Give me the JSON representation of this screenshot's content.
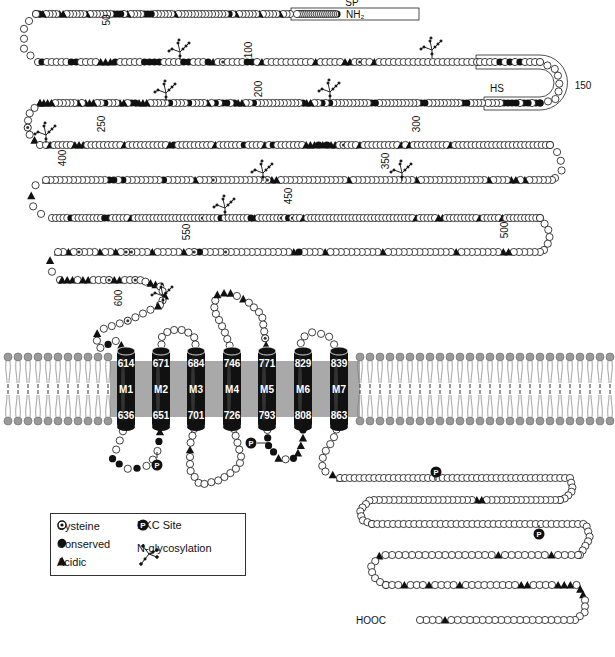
{
  "labels": {
    "n_terminus": "NH₂",
    "c_terminus": "HOOC",
    "signal_peptide": "SP",
    "hs_region": "HS",
    "residue_numbers": [
      {
        "text": "50",
        "x": 110,
        "y": 20,
        "rot": -90
      },
      {
        "text": "100",
        "x": 252,
        "y": 50,
        "rot": -90
      },
      {
        "text": "150",
        "x": 583,
        "y": 89,
        "rot": 0
      },
      {
        "text": "200",
        "x": 262,
        "y": 89,
        "rot": -90
      },
      {
        "text": "250",
        "x": 105,
        "y": 124,
        "rot": -90
      },
      {
        "text": "300",
        "x": 420,
        "y": 124,
        "rot": -90
      },
      {
        "text": "350",
        "x": 389,
        "y": 161,
        "rot": -90
      },
      {
        "text": "400",
        "x": 66,
        "y": 158,
        "rot": -90
      },
      {
        "text": "450",
        "x": 292,
        "y": 196,
        "rot": -90
      },
      {
        "text": "500",
        "x": 508,
        "y": 230,
        "rot": -90
      },
      {
        "text": "550",
        "x": 190,
        "y": 232,
        "rot": -90
      },
      {
        "text": "600",
        "x": 122,
        "y": 298,
        "rot": -90
      }
    ]
  },
  "helices": [
    {
      "name": "M1",
      "top": "614",
      "bottom": "636",
      "x": 126
    },
    {
      "name": "M2",
      "top": "671",
      "bottom": "651",
      "x": 161
    },
    {
      "name": "M3",
      "top": "684",
      "bottom": "701",
      "x": 196
    },
    {
      "name": "M4",
      "top": "746",
      "bottom": "726",
      "x": 232
    },
    {
      "name": "M5",
      "top": "771",
      "bottom": "793",
      "x": 267
    },
    {
      "name": "M6",
      "top": "829",
      "bottom": "808",
      "x": 303
    },
    {
      "name": "M7",
      "top": "839",
      "bottom": "863",
      "x": 339
    }
  ],
  "legend": {
    "items": [
      {
        "symbol": "cysteine",
        "label": "Cysteine"
      },
      {
        "symbol": "conserved",
        "label": "Conserved"
      },
      {
        "symbol": "acidic",
        "label": "Acidic"
      },
      {
        "symbol": "pkc",
        "label": "PKC Site"
      },
      {
        "symbol": "glyco",
        "label": "N-glycosylation"
      }
    ],
    "pkc_glyph": "P"
  },
  "membrane": {
    "color": "#a9a9a9",
    "head_color": "#9a9a9a",
    "top_y": 357,
    "bottom_y": 421
  },
  "chains": [
    {
      "id": "row1",
      "pts": [
        [
          337,
          14
        ],
        [
          297,
          14
        ]
      ],
      "seq": "cooooooooooooooooooooo"
    },
    {
      "id": "row1b",
      "pts": [
        [
          290,
          14
        ],
        [
          36,
          14
        ]
      ],
      "seq": "oooaoooooaooooooaocoooooooooooooooaoooooocccooooaocccoooooooaooooooaaooooaco"
    },
    {
      "id": "turn1",
      "pts": [
        [
          36,
          14
        ],
        [
          24,
          26
        ],
        [
          24,
          50
        ],
        [
          38,
          62
        ]
      ],
      "seq": "ooooooo"
    },
    {
      "id": "row2",
      "pts": [
        [
          42,
          62
        ],
        [
          477,
          62
        ]
      ],
      "seq": "coooooccooooaaacoooooccccooooccooocaoyooooccoaooooooooooaoooooaaoyooaooooooooooooooooooooo"
    },
    {
      "id": "hsTop",
      "pts": [
        [
          480,
          62
        ],
        [
          540,
          62
        ]
      ],
      "seq": "oooocococoooc"
    },
    {
      "id": "turnHS",
      "pts": [
        [
          540,
          62
        ],
        [
          557,
          70
        ],
        [
          560,
          88
        ],
        [
          555,
          100
        ],
        [
          540,
          103
        ]
      ],
      "seq": "ooooooooc"
    },
    {
      "id": "hsBot",
      "pts": [
        [
          540,
          103
        ],
        [
          488,
          103
        ]
      ],
      "seq": "ccoccoccccoooo"
    },
    {
      "id": "row3",
      "pts": [
        [
          482,
          103
        ],
        [
          40,
          103
        ]
      ],
      "seq": "ooooccoooooooooccoooooooooooccoooooooooococooaacoooooooooooocooaacoccocoaoooocoooocoooooaaaccoaaooocooaaaoaooooooaaaa"
    },
    {
      "id": "turn2",
      "pts": [
        [
          40,
          103
        ],
        [
          30,
          112
        ],
        [
          27,
          125
        ],
        [
          30,
          136
        ],
        [
          40,
          145
        ]
      ],
      "seq": "aoooyoao"
    },
    {
      "id": "row4",
      "pts": [
        [
          46,
          145
        ],
        [
          550,
          145
        ]
      ],
      "seq": "oaoooooaaaoooooooooaooooooooooacoooooooooaoooooocooooaocoooooooaaacacaaoyoooaoooooooooaoaoooooooooaoooooooooooooooooooooooo"
    },
    {
      "id": "turn3",
      "pts": [
        [
          550,
          145
        ],
        [
          560,
          155
        ],
        [
          562,
          170
        ],
        [
          555,
          178
        ]
      ],
      "seq": "ooooo"
    },
    {
      "id": "row5",
      "pts": [
        [
          552,
          180
        ],
        [
          46,
          180
        ]
      ],
      "seq": "ooooooaoaaooooaoooooooooooooooaooooooooooooooaoooooooooooooooaayoooooooooooyoooaoooooocoooooooococcoooooooooooooa"
    },
    {
      "id": "turn4",
      "pts": [
        [
          46,
          180
        ],
        [
          34,
          186
        ],
        [
          30,
          200
        ],
        [
          36,
          212
        ],
        [
          52,
          218
        ]
      ],
      "seq": "ooaooo"
    },
    {
      "id": "row6",
      "pts": [
        [
          56,
          218
        ],
        [
          540,
          218
        ]
      ],
      "seq": "oooocooooooooccoooooaooooooooooooooooooyoooocooooooocaooooooyocyooaoooooooooooooooooooooooooooooaoooooaaoooooooooaoooooaoooooooooo"
    },
    {
      "id": "turn5",
      "pts": [
        [
          540,
          218
        ],
        [
          548,
          228
        ],
        [
          550,
          240
        ],
        [
          544,
          250
        ]
      ],
      "seq": "oooooo"
    },
    {
      "id": "row7",
      "pts": [
        [
          540,
          252
        ],
        [
          58,
          252
        ]
      ],
      "seq": "ooooooaaooooooooaoooooooooooooaooooooooooaoooocaooooooooooooyoooocyoaoooooaoooyyoaooaoooyoaoa"
    },
    {
      "id": "turn6",
      "pts": [
        [
          58,
          252
        ],
        [
          50,
          260
        ],
        [
          52,
          272
        ],
        [
          60,
          280
        ]
      ],
      "seq": "oaoo"
    },
    {
      "id": "row8",
      "pts": [
        [
          62,
          280
        ],
        [
          140,
          280
        ],
        [
          160,
          286
        ],
        [
          165,
          296
        ],
        [
          160,
          305
        ]
      ],
      "seq": "aaaoaaoooyaaooyooaaooaoo"
    },
    {
      "id": "loopN",
      "pts": [
        [
          158,
          306
        ],
        [
          130,
          320
        ],
        [
          100,
          330
        ],
        [
          95,
          336
        ],
        [
          100,
          348
        ],
        [
          118,
          340
        ],
        [
          126,
          352
        ]
      ],
      "seq": "aoooyoooaoocoao"
    },
    {
      "id": "ic1",
      "pts": [
        [
          126,
          422
        ],
        [
          120,
          440
        ],
        [
          112,
          460
        ],
        [
          130,
          470
        ],
        [
          150,
          465
        ],
        [
          158,
          450
        ],
        [
          161,
          422
        ]
      ],
      "seq": "ooooccocooocac"
    },
    {
      "id": "ec1",
      "pts": [
        [
          161,
          352
        ],
        [
          162,
          336
        ],
        [
          170,
          330
        ],
        [
          185,
          330
        ],
        [
          195,
          338
        ],
        [
          196,
          352
        ]
      ],
      "seq": "cooooooooc"
    },
    {
      "id": "ic2",
      "pts": [
        [
          196,
          422
        ],
        [
          190,
          445
        ],
        [
          190,
          470
        ],
        [
          200,
          485
        ],
        [
          220,
          480
        ],
        [
          235,
          470
        ],
        [
          242,
          460
        ],
        [
          232,
          422
        ]
      ],
      "seq": "ooooaoooooooooooooooooc"
    },
    {
      "id": "ec2",
      "pts": [
        [
          232,
          352
        ],
        [
          224,
          330
        ],
        [
          214,
          310
        ],
        [
          216,
          295
        ],
        [
          228,
          292
        ],
        [
          246,
          300
        ],
        [
          262,
          315
        ],
        [
          267,
          352
        ]
      ],
      "seq": "oooooooooaaaoaooooooyao"
    },
    {
      "id": "ic3",
      "pts": [
        [
          267,
          422
        ],
        [
          268,
          445
        ],
        [
          280,
          460
        ],
        [
          296,
          458
        ],
        [
          303,
          440
        ],
        [
          303,
          422
        ]
      ],
      "seq": "cocccaocaaacc"
    },
    {
      "id": "ec3",
      "pts": [
        [
          303,
          352
        ],
        [
          300,
          340
        ],
        [
          310,
          332
        ],
        [
          328,
          335
        ],
        [
          339,
          352
        ]
      ],
      "seq": "oooooooc"
    },
    {
      "id": "ct1",
      "pts": [
        [
          339,
          422
        ],
        [
          333,
          440
        ],
        [
          323,
          455
        ],
        [
          322,
          470
        ],
        [
          340,
          478
        ]
      ],
      "seq": "ooooooooaa"
    },
    {
      "id": "ct2",
      "pts": [
        [
          340,
          478
        ],
        [
          570,
          478
        ],
        [
          573,
          490
        ],
        [
          566,
          498
        ],
        [
          560,
          500
        ]
      ],
      "seq": "oooooooooooooooooooooooooooooooooooooooooooooooooooooo"
    },
    {
      "id": "ct3",
      "pts": [
        [
          560,
          500
        ],
        [
          370,
          500
        ],
        [
          360,
          510
        ],
        [
          362,
          520
        ],
        [
          372,
          524
        ]
      ],
      "seq": "ooooooooooooooooaaooooooooooooooooooooooooooooo"
    },
    {
      "id": "ct4",
      "pts": [
        [
          372,
          524
        ],
        [
          586,
          524
        ],
        [
          590,
          538
        ],
        [
          580,
          555
        ]
      ],
      "seq": "oooooooooooooooooooooooooooooooooooooooooooooooo"
    },
    {
      "id": "ct5",
      "pts": [
        [
          578,
          555
        ],
        [
          380,
          555
        ],
        [
          370,
          568
        ],
        [
          376,
          580
        ],
        [
          386,
          585
        ]
      ],
      "seq": "ooooaoooooooaoooooooooooooooooaoooooo"
    },
    {
      "id": "ct6",
      "pts": [
        [
          386,
          585
        ],
        [
          578,
          585
        ],
        [
          585,
          598
        ],
        [
          585,
          612
        ],
        [
          575,
          620
        ]
      ],
      "seq": "oooaoooaooooaoooooooooaaooooaaaoaaooooo"
    },
    {
      "id": "ct7",
      "pts": [
        [
          570,
          620
        ],
        [
          420,
          620
        ]
      ],
      "seq": "ooooooooooooooooooooaoooo"
    }
  ],
  "glycosylation_sites": [
    {
      "x": 180,
      "y": 52
    },
    {
      "x": 432,
      "y": 50
    },
    {
      "x": 166,
      "y": 93
    },
    {
      "x": 330,
      "y": 92
    },
    {
      "x": 46,
      "y": 135
    },
    {
      "x": 263,
      "y": 173
    },
    {
      "x": 402,
      "y": 173
    },
    {
      "x": 225,
      "y": 208
    },
    {
      "x": 163,
      "y": 296
    }
  ],
  "pkc_sites": [
    {
      "x": 157,
      "y": 465,
      "stem": [
        [
          157,
          458
        ],
        [
          157,
          452
        ]
      ]
    },
    {
      "x": 251,
      "y": 443,
      "stem": [
        [
          257,
          443
        ],
        [
          267,
          443
        ]
      ]
    },
    {
      "x": 436,
      "y": 472,
      "stem": [
        [
          436,
          477
        ],
        [
          436,
          480
        ]
      ]
    },
    {
      "x": 539,
      "y": 534,
      "stem": [
        [
          539,
          528
        ],
        [
          539,
          525
        ]
      ]
    }
  ],
  "boxes": {
    "sp": {
      "x": 291,
      "y": 8,
      "w": 128,
      "h": 12,
      "label_x": 352,
      "label_y": 6
    },
    "hs": {
      "label_x": 497,
      "label_y": 92
    }
  }
}
